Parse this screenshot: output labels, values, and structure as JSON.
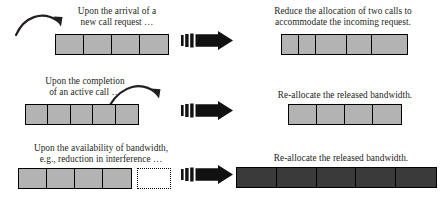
{
  "figure": {
    "type": "process-diagram",
    "title": ""
  },
  "palette": {
    "cell_fill": "#b3b3b3",
    "cell_fill_dark": "#3a3a3a",
    "stroke": "#000000",
    "text": "#231f20",
    "background": "#ffffff"
  },
  "rows": [
    {
      "id": "row-arrival",
      "left": {
        "caption": "Upon the arrival of a\nnew call request …",
        "curved_arrow": "curved-arrow-down-right",
        "bar": {
          "name": "bandwidth-bar-before-arrival",
          "fill": "light",
          "cells": 4,
          "cell_widths": [
            28,
            28,
            28,
            28
          ]
        }
      },
      "arrow": "block-arrow-right",
      "right": {
        "caption": "Reduce the allocation of two calls to\naccommodate the incoming request.",
        "bar": {
          "name": "bandwidth-bar-after-arrival",
          "fill": "light",
          "cells": 5,
          "cell_widths": [
            17,
            17,
            28,
            22,
            28
          ]
        }
      }
    },
    {
      "id": "row-completion",
      "left": {
        "caption": "Upon the completion\nof an active call …",
        "curved_arrow": "curved-arrow-up-right",
        "bar": {
          "name": "bandwidth-bar-before-completion",
          "fill": "light",
          "cells": 5,
          "cell_widths": [
            22,
            22,
            22,
            22,
            22
          ]
        }
      },
      "arrow": "block-arrow-right",
      "right": {
        "caption": "Re-allocate the released bandwidth.",
        "bar": {
          "name": "bandwidth-bar-after-completion",
          "fill": "light",
          "cells": 4,
          "cell_widths": [
            28,
            28,
            28,
            28
          ]
        }
      }
    },
    {
      "id": "row-availability",
      "left": {
        "caption": "Upon the availability of bandwidth,\ne.g., reduction in interference …",
        "curved_arrow": "",
        "bar": {
          "name": "bandwidth-bar-before-availability",
          "fill": "light",
          "cells": 4,
          "cell_widths": [
            28,
            28,
            28,
            28
          ]
        },
        "free_block": {
          "name": "free-bandwidth-dotted-box",
          "style": "dotted",
          "width": 34
        }
      },
      "arrow": "block-arrow-right",
      "right": {
        "caption": "Re-allocate the released bandwidth.",
        "bar": {
          "name": "bandwidth-bar-after-availability",
          "fill": "dark",
          "cells": 5,
          "cell_widths": [
            39,
            39,
            39,
            39,
            39
          ]
        }
      }
    }
  ]
}
